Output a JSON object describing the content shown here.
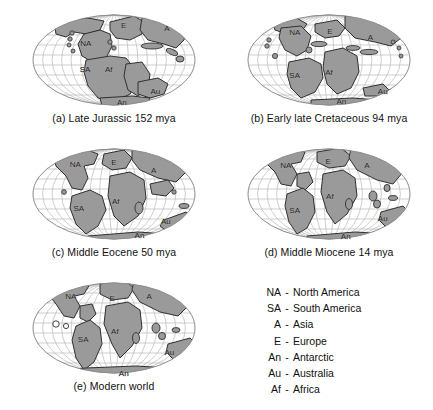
{
  "figure": {
    "type": "paleogeographic-map-series",
    "projection": "elliptical (Mollweide-style)",
    "colors": {
      "land_fill": "#9a9a9a",
      "land_stroke": "#303030",
      "graticule": "#b9b9b9",
      "ellipse_outline": "#8c8c8c",
      "background": "#ffffff",
      "text": "#101010"
    },
    "graticule": {
      "meridian_count": 17,
      "parallel_count": 9
    }
  },
  "panels": [
    {
      "id": "a",
      "caption": "(a) Late Jurassic 152 mya",
      "age_mya": 152,
      "epoch": "Late Jurassic",
      "labels": [
        {
          "text": "NA",
          "x": 0.34,
          "y": 0.34
        },
        {
          "text": "E",
          "x": 0.555,
          "y": 0.155
        },
        {
          "text": "A",
          "x": 0.8,
          "y": 0.185
        },
        {
          "text": "SA",
          "x": 0.335,
          "y": 0.595
        },
        {
          "text": "Af",
          "x": 0.47,
          "y": 0.6
        },
        {
          "text": "An",
          "x": 0.545,
          "y": 0.925
        },
        {
          "text": "Au",
          "x": 0.735,
          "y": 0.815
        }
      ]
    },
    {
      "id": "b",
      "caption": "(b) Early late Cretaceous 94 mya",
      "age_mya": 94,
      "epoch": "Early late Cretaceous",
      "labels": [
        {
          "text": "NA",
          "x": 0.305,
          "y": 0.225
        },
        {
          "text": "E",
          "x": 0.505,
          "y": 0.215
        },
        {
          "text": "A",
          "x": 0.735,
          "y": 0.275
        },
        {
          "text": "SA",
          "x": 0.305,
          "y": 0.66
        },
        {
          "text": "Af",
          "x": 0.5,
          "y": 0.63
        },
        {
          "text": "An",
          "x": 0.57,
          "y": 0.915
        },
        {
          "text": "Au",
          "x": 0.805,
          "y": 0.815
        }
      ]
    },
    {
      "id": "c",
      "caption": "(c) Middle Eocene 50 mya",
      "age_mya": 50,
      "epoch": "Middle Eocene",
      "labels": [
        {
          "text": "NA",
          "x": 0.28,
          "y": 0.205
        },
        {
          "text": "E",
          "x": 0.5,
          "y": 0.185
        },
        {
          "text": "A",
          "x": 0.725,
          "y": 0.265
        },
        {
          "text": "SA",
          "x": 0.3,
          "y": 0.645
        },
        {
          "text": "Af",
          "x": 0.51,
          "y": 0.575
        },
        {
          "text": "An",
          "x": 0.645,
          "y": 0.915
        },
        {
          "text": "Au",
          "x": 0.795,
          "y": 0.775
        }
      ]
    },
    {
      "id": "d",
      "caption": "(d) Middle Miocene 14 mya",
      "age_mya": 14,
      "epoch": "Middle Miocene",
      "labels": [
        {
          "text": "NA",
          "x": 0.255,
          "y": 0.215
        },
        {
          "text": "E",
          "x": 0.495,
          "y": 0.175
        },
        {
          "text": "A",
          "x": 0.715,
          "y": 0.215
        },
        {
          "text": "SA",
          "x": 0.305,
          "y": 0.665
        },
        {
          "text": "Af",
          "x": 0.505,
          "y": 0.525
        },
        {
          "text": "An",
          "x": 0.595,
          "y": 0.925
        },
        {
          "text": "Au",
          "x": 0.805,
          "y": 0.745
        }
      ]
    },
    {
      "id": "e",
      "caption": "(e) Modern world",
      "age_mya": 0,
      "epoch": "Modern world",
      "labels": [
        {
          "text": "NA",
          "x": 0.255,
          "y": 0.185
        },
        {
          "text": "E",
          "x": 0.49,
          "y": 0.205
        },
        {
          "text": "A",
          "x": 0.7,
          "y": 0.185
        },
        {
          "text": "SA",
          "x": 0.325,
          "y": 0.615
        },
        {
          "text": "Af",
          "x": 0.505,
          "y": 0.535
        },
        {
          "text": "An",
          "x": 0.555,
          "y": 0.955
        },
        {
          "text": "Au",
          "x": 0.815,
          "y": 0.745
        }
      ]
    }
  ],
  "legend": {
    "dash": "-",
    "entries": [
      {
        "abbr": "NA",
        "name": "North America"
      },
      {
        "abbr": "SA",
        "name": "South America"
      },
      {
        "abbr": "A",
        "name": "Asia"
      },
      {
        "abbr": "E",
        "name": "Europe"
      },
      {
        "abbr": "An",
        "name": "Antarctic"
      },
      {
        "abbr": "Au",
        "name": "Australia"
      },
      {
        "abbr": "Af",
        "name": "Africa"
      }
    ]
  }
}
